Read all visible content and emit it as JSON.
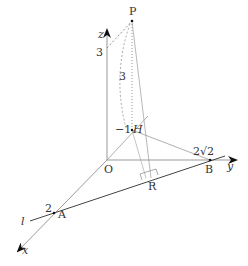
{
  "diagram": {
    "points": {
      "P": {
        "label": "P",
        "x": 132,
        "y": 21
      },
      "O": {
        "label": "O",
        "x": 107,
        "y": 160
      },
      "H": {
        "label": "H",
        "x": 132,
        "y": 130
      },
      "B": {
        "label": "B",
        "x": 210,
        "y": 160
      },
      "R": {
        "label": "R",
        "x": 151,
        "y": 178
      },
      "A": {
        "label": "A",
        "x": 54,
        "y": 213
      }
    },
    "axes": {
      "z": {
        "label": "z"
      },
      "y": {
        "label": "y"
      },
      "x": {
        "label": "x"
      }
    },
    "line_label": "l",
    "annotations": {
      "z_height": "3",
      "ph_length": "3",
      "h_coord": "−1",
      "b_coord": "2√2",
      "a_coord": "2"
    }
  }
}
